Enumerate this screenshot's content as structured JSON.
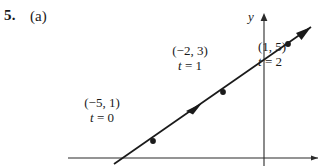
{
  "exercise": {
    "number": "5.",
    "part": "(a)"
  },
  "figure": {
    "axes": {
      "y_label": "y"
    },
    "points": [
      {
        "id": "t0",
        "coord": "(−5, 1)",
        "param_var": "t",
        "param_eq": " = 0",
        "param": "t = 0"
      },
      {
        "id": "t1",
        "coord": "(−2, 3)",
        "param_var": "t",
        "param_eq": " = 1",
        "param": "t = 1"
      },
      {
        "id": "t2",
        "coord": "(1, 5)",
        "param_var": "t",
        "param_eq": " = 2",
        "param": "t = 2"
      }
    ],
    "colors": {
      "ink": "#1a1a1a",
      "axis": "#2b2b2b",
      "background": "#ffffff"
    }
  }
}
